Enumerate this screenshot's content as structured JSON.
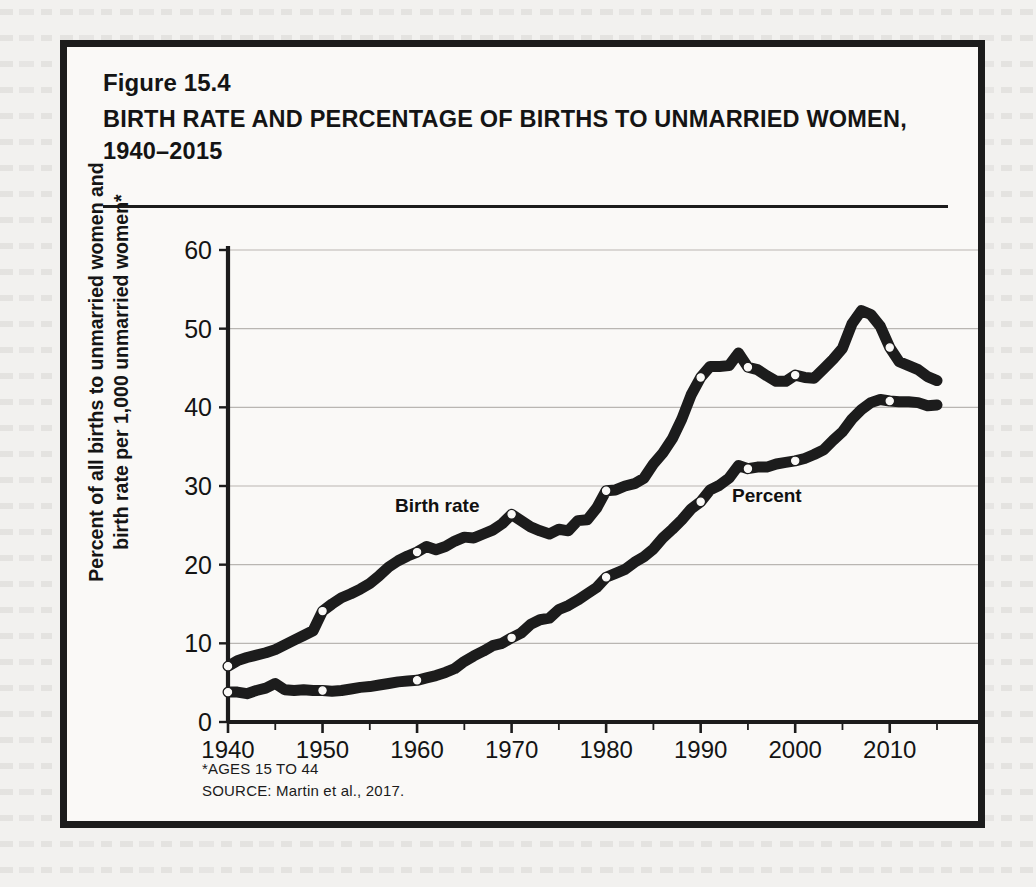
{
  "figure": {
    "number": "Figure 15.4",
    "title": "BIRTH RATE AND PERCENTAGE OF BIRTHS TO UNMARRIED WOMEN, 1940–2015",
    "footnote": "*AGES 15 TO 44",
    "source": "SOURCE: Martin et al., 2017."
  },
  "chart_data": {
    "type": "line",
    "title": "BIRTH RATE AND PERCENTAGE OF BIRTHS TO UNMARRIED WOMEN, 1940–2015",
    "xlabel": "",
    "ylabel": "Percent of all births to unmarried women and birth rate per 1,000 unmarried women*",
    "xlim": [
      1940,
      2015
    ],
    "ylim": [
      0,
      60
    ],
    "ytick_step": 10,
    "yticks": [
      0,
      10,
      20,
      30,
      40,
      50,
      60
    ],
    "xticks": [
      1940,
      1950,
      1960,
      1970,
      1980,
      1990,
      2000,
      2010
    ],
    "xtick_minor_step": 5,
    "grid": "horizontal",
    "legend": "inline-labels",
    "line_color": "#1c1c1c",
    "marker_style": "open-circle",
    "series": [
      {
        "name": "Birth rate",
        "label_text": "Birth rate",
        "marker_years": [
          1940,
          1950,
          1960,
          1970,
          1980,
          1990,
          1995,
          2000,
          2010
        ],
        "x": [
          1940,
          1941,
          1942,
          1943,
          1944,
          1945,
          1946,
          1947,
          1948,
          1949,
          1950,
          1951,
          1952,
          1953,
          1954,
          1955,
          1956,
          1957,
          1958,
          1959,
          1960,
          1961,
          1962,
          1963,
          1964,
          1965,
          1966,
          1967,
          1968,
          1969,
          1970,
          1971,
          1972,
          1973,
          1974,
          1975,
          1976,
          1977,
          1978,
          1979,
          1980,
          1981,
          1982,
          1983,
          1984,
          1985,
          1986,
          1987,
          1988,
          1989,
          1990,
          1991,
          1992,
          1993,
          1994,
          1995,
          1996,
          1997,
          1998,
          1999,
          2000,
          2001,
          2002,
          2003,
          2004,
          2005,
          2006,
          2007,
          2008,
          2009,
          2010,
          2011,
          2012,
          2013,
          2014,
          2015
        ],
        "y": [
          7.1,
          7.8,
          8.2,
          8.5,
          8.8,
          9.2,
          9.8,
          10.4,
          11.0,
          11.6,
          14.1,
          15.0,
          15.8,
          16.3,
          16.9,
          17.6,
          18.6,
          19.7,
          20.5,
          21.1,
          21.6,
          22.3,
          21.9,
          22.3,
          23.0,
          23.5,
          23.4,
          23.9,
          24.4,
          25.2,
          26.4,
          25.6,
          24.8,
          24.3,
          23.9,
          24.5,
          24.3,
          25.6,
          25.7,
          27.2,
          29.4,
          29.5,
          30.0,
          30.3,
          31.0,
          32.8,
          34.2,
          36.0,
          38.5,
          41.6,
          43.8,
          45.2,
          45.2,
          45.3,
          46.9,
          45.1,
          44.8,
          44.0,
          43.3,
          43.3,
          44.1,
          43.8,
          43.7,
          44.9,
          46.1,
          47.5,
          50.6,
          52.3,
          51.8,
          50.3,
          47.6,
          45.8,
          45.3,
          44.8,
          43.9,
          43.4
        ]
      },
      {
        "name": "Percent",
        "label_text": "Percent",
        "marker_years": [
          1940,
          1950,
          1960,
          1970,
          1980,
          1990,
          1995,
          2000,
          2010
        ],
        "x": [
          1940,
          1941,
          1942,
          1943,
          1944,
          1945,
          1946,
          1947,
          1948,
          1949,
          1950,
          1951,
          1952,
          1953,
          1954,
          1955,
          1956,
          1957,
          1958,
          1959,
          1960,
          1961,
          1962,
          1963,
          1964,
          1965,
          1966,
          1967,
          1968,
          1969,
          1970,
          1971,
          1972,
          1973,
          1974,
          1975,
          1976,
          1977,
          1978,
          1979,
          1980,
          1981,
          1982,
          1983,
          1984,
          1985,
          1986,
          1987,
          1988,
          1989,
          1990,
          1991,
          1992,
          1993,
          1994,
          1995,
          1996,
          1997,
          1998,
          1999,
          2000,
          2001,
          2002,
          2003,
          2004,
          2005,
          2006,
          2007,
          2008,
          2009,
          2010,
          2011,
          2012,
          2013,
          2014,
          2015
        ],
        "y": [
          3.8,
          3.8,
          3.6,
          4.0,
          4.3,
          4.9,
          4.1,
          4.0,
          4.1,
          4.0,
          4.0,
          3.9,
          4.0,
          4.2,
          4.4,
          4.5,
          4.7,
          4.9,
          5.1,
          5.2,
          5.3,
          5.6,
          5.9,
          6.3,
          6.8,
          7.7,
          8.4,
          9.0,
          9.7,
          10.0,
          10.7,
          11.3,
          12.4,
          13.0,
          13.2,
          14.3,
          14.8,
          15.5,
          16.3,
          17.1,
          18.4,
          18.9,
          19.4,
          20.3,
          21.0,
          22.0,
          23.4,
          24.5,
          25.7,
          27.1,
          28.0,
          29.5,
          30.1,
          31.0,
          32.6,
          32.2,
          32.4,
          32.4,
          32.8,
          33.0,
          33.2,
          33.5,
          34.0,
          34.6,
          35.8,
          36.9,
          38.5,
          39.7,
          40.6,
          41.0,
          40.8,
          40.7,
          40.7,
          40.6,
          40.2,
          40.3
        ]
      }
    ]
  }
}
